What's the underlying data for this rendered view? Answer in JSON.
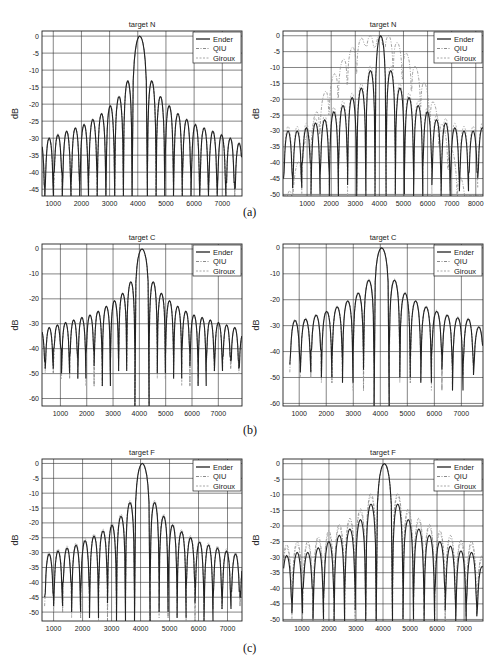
{
  "figure": {
    "captions": [
      "(a)",
      "(b)",
      "(c)"
    ],
    "legend": [
      "Ender",
      "QIU",
      "Giroux"
    ],
    "series_styles": {
      "Ender": {
        "color": "#222222",
        "dash": "none",
        "width": 1.1
      },
      "QIU": {
        "color": "#8a8a8a",
        "dash": "3,1.5,1,1.5",
        "width": 0.8
      },
      "Giroux": {
        "color": "#a8a8a8",
        "dash": "2,1.5",
        "width": 0.8
      }
    }
  },
  "chart_data": [
    {
      "id": "a-left",
      "type": "line",
      "title": "target N",
      "xlabel": "",
      "ylabel": "dB",
      "xlim": [
        600,
        7700
      ],
      "ylim": [
        -47,
        1.5
      ],
      "xticks": [
        1000,
        2000,
        3000,
        4000,
        5000,
        6000,
        7000
      ],
      "yticks": [
        0,
        -5,
        -10,
        -15,
        -20,
        -25,
        -30,
        -35,
        -40,
        -45
      ],
      "grid": true,
      "legend_position": "upper right",
      "mainlobe_center": 4070,
      "mainlobe_halfwidth": 270,
      "lobe_spacing": 310,
      "sidelobe_peaks_left": [
        -13.2,
        -17.8,
        -20.5,
        -22.8,
        -24.5,
        -26,
        -27,
        -28,
        -29,
        -30,
        -30.5
      ],
      "sidelobe_peaks_right": [
        -13.2,
        -17.8,
        -20.5,
        -22.8,
        -24.5,
        -26,
        -27,
        -28,
        -29,
        -30,
        -31.5
      ],
      "series": [
        {
          "name": "Ender",
          "offset": 0
        },
        {
          "name": "QIU",
          "offset": 0
        },
        {
          "name": "Giroux",
          "offset": 0.3
        }
      ]
    },
    {
      "id": "a-right",
      "type": "line",
      "title": "target N",
      "xlabel": "",
      "ylabel": "dB",
      "xlim": [
        0,
        8300
      ],
      "ylim": [
        -50.5,
        1.5
      ],
      "xticks": [
        1000,
        2000,
        3000,
        4000,
        5000,
        6000,
        7000,
        8000
      ],
      "yticks": [
        0,
        -5,
        -10,
        -15,
        -20,
        -25,
        -30,
        -35,
        -40,
        -45,
        -50
      ],
      "grid": true,
      "legend_position": "upper right",
      "mainlobe_center": 4050,
      "mainlobe_halfwidth": 230,
      "lobe_spacing": 380,
      "sidelobe_peaks_left": [
        -11,
        -16.5,
        -19.5,
        -22,
        -24,
        -26.5,
        -27.5,
        -29,
        -30,
        -30
      ],
      "sidelobe_peaks_right": [
        -11,
        -16.5,
        -19.5,
        -22,
        -24,
        -26.5,
        -27.5,
        -29,
        -30,
        -30,
        -29
      ],
      "series": [
        {
          "name": "Ender",
          "offset": 0
        },
        {
          "name": "QIU",
          "broad_peak": {
            "center": 3500,
            "level": 0,
            "shoulder": -4
          },
          "note": "broadened mainlobe with secondary peak near 3400"
        },
        {
          "name": "Giroux",
          "offset": 1.5
        }
      ]
    },
    {
      "id": "b-left",
      "type": "line",
      "title": "target C",
      "xlabel": "",
      "ylabel": "dB",
      "xlim": [
        300,
        7900
      ],
      "ylim": [
        -63,
        2
      ],
      "xticks": [
        1000,
        2000,
        3000,
        4000,
        5000,
        6000,
        7000
      ],
      "yticks": [
        0,
        -10,
        -20,
        -30,
        -40,
        -50,
        -60
      ],
      "grid": true,
      "legend_position": "upper right",
      "mainlobe_center": 4100,
      "mainlobe_halfwidth": 270,
      "lobe_spacing": 310,
      "sidelobe_peaks_left": [
        -13.2,
        -17.8,
        -20.8,
        -23,
        -25,
        -26.5,
        -27.5,
        -28.5,
        -29.5,
        -30.5,
        -31.5,
        -32.5
      ],
      "sidelobe_peaks_right": [
        -13.2,
        -17.8,
        -20.8,
        -23,
        -25,
        -26.5,
        -27.5,
        -28.5,
        -29.5,
        -30.5,
        -31.5,
        -34
      ],
      "series": [
        {
          "name": "Ender",
          "offset": 0
        },
        {
          "name": "QIU",
          "offset": 0
        },
        {
          "name": "Giroux",
          "offset": 0
        }
      ]
    },
    {
      "id": "b-right",
      "type": "line",
      "title": "target C",
      "xlabel": "",
      "ylabel": "dB",
      "xlim": [
        400,
        7800
      ],
      "ylim": [
        -61,
        1.5
      ],
      "xticks": [
        1000,
        2000,
        3000,
        4000,
        5000,
        6000,
        7000
      ],
      "yticks": [
        0,
        -10,
        -20,
        -30,
        -40,
        -50,
        -60
      ],
      "grid": true,
      "legend_position": "upper right",
      "mainlobe_center": 4050,
      "mainlobe_halfwidth": 280,
      "lobe_spacing": 390,
      "sidelobe_peaks_left": [
        -12.5,
        -17.5,
        -20.5,
        -22.8,
        -24.5,
        -26,
        -27.5,
        -28
      ],
      "sidelobe_peaks_right": [
        -12.5,
        -17.5,
        -20.5,
        -22.8,
        -24.5,
        -26,
        -27,
        -27.5,
        -30.5
      ],
      "series": [
        {
          "name": "Ender",
          "offset": 0
        },
        {
          "name": "QIU",
          "offset": 0
        },
        {
          "name": "Giroux",
          "offset": 0.5
        }
      ]
    },
    {
      "id": "c-left",
      "type": "line",
      "title": "target F",
      "xlabel": "",
      "ylabel": "dB",
      "xlim": [
        600,
        7500
      ],
      "ylim": [
        -53,
        1.5
      ],
      "xticks": [
        1000,
        2000,
        3000,
        4000,
        5000,
        6000,
        7000
      ],
      "yticks": [
        0,
        -5,
        -10,
        -15,
        -20,
        -25,
        -30,
        -35,
        -40,
        -45,
        -50
      ],
      "grid": true,
      "legend_position": "upper right",
      "mainlobe_center": 4060,
      "mainlobe_halfwidth": 270,
      "lobe_spacing": 310,
      "sidelobe_peaks_left": [
        -13.2,
        -17.8,
        -20.8,
        -22.8,
        -24.5,
        -26,
        -27.5,
        -28.5,
        -29.5,
        -30.5
      ],
      "sidelobe_peaks_right": [
        -13.2,
        -17.8,
        -20.8,
        -23,
        -25,
        -26.5,
        -27.5,
        -28.5,
        -29.5,
        -30.5,
        -32
      ],
      "series": [
        {
          "name": "Ender",
          "offset": 0
        },
        {
          "name": "QIU",
          "offset": 0.3
        },
        {
          "name": "Giroux",
          "offset": 0.8
        }
      ]
    },
    {
      "id": "c-right",
      "type": "line",
      "title": "target F",
      "xlabel": "",
      "ylabel": "dB",
      "xlim": [
        300,
        7700
      ],
      "ylim": [
        -50.5,
        1.5
      ],
      "xticks": [
        1000,
        2000,
        3000,
        4000,
        5000,
        6000,
        7000
      ],
      "yticks": [
        0,
        -5,
        -10,
        -15,
        -20,
        -25,
        -30,
        -35,
        -40,
        -45,
        -50
      ],
      "grid": true,
      "legend_position": "upper right",
      "mainlobe_center": 4050,
      "mainlobe_halfwidth": 300,
      "lobe_spacing": 390,
      "sidelobe_peaks_left": [
        -13,
        -18,
        -21,
        -23,
        -25,
        -27,
        -28.5,
        -28.5,
        -29.5
      ],
      "sidelobe_peaks_right": [
        -13,
        -18,
        -21,
        -23,
        -25,
        -26.5,
        -28,
        -28.5,
        -33
      ],
      "series": [
        {
          "name": "Ender",
          "offset": 0
        },
        {
          "name": "QIU",
          "offset": 3.5,
          "note": "higher first sidelobes near -8.5 dB"
        },
        {
          "name": "Giroux",
          "offset": 2.5
        }
      ]
    }
  ]
}
